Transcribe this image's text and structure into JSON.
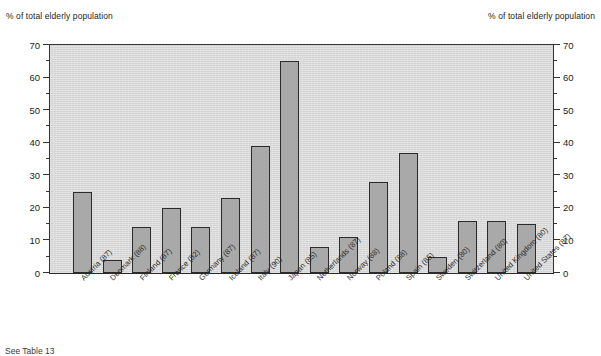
{
  "figure": {
    "axis_unit_label_left": "% of total elderly population",
    "axis_unit_label_right": "% of total elderly population",
    "footnote": "See Table 13"
  },
  "colors": {
    "plot_background": "#d3d3d3",
    "bar_fill": "#a9a9a9",
    "bar_border": "#2b2b2b",
    "axis": "#333333",
    "text": "#1d1d1d",
    "page_background": "#ffffff"
  },
  "chart_data": {
    "type": "bar",
    "title": "",
    "subtitle": "",
    "xlabel": "",
    "ylabel": "% of total elderly population",
    "ylabel_right": "% of total elderly population",
    "ylim": [
      0,
      70
    ],
    "yticks": [
      0,
      10,
      20,
      30,
      40,
      50,
      60,
      70
    ],
    "ytick_labels": [
      "0",
      "10",
      "20",
      "30",
      "40",
      "50",
      "60",
      "70"
    ],
    "yticks_minor": [
      5,
      15,
      25,
      35,
      45,
      55,
      65
    ],
    "grid": false,
    "legend": null,
    "legend_position": "none",
    "categories": [
      "Austria (87)",
      "Denmark (88)",
      "Finland (87)",
      "France (82)",
      "Germany (87)",
      "Iceland (87)",
      "Italy (90)",
      "Japan (85)",
      "Netherlands (87)",
      "Norway (88)",
      "Poland (88)",
      "Spain (85)",
      "Sweden (80)",
      "Switzerland (80)",
      "United Kingdom (80)",
      "United States (87)"
    ],
    "values": [
      25,
      4,
      14,
      20,
      14,
      23,
      39,
      65,
      8,
      11,
      28,
      37,
      5,
      16,
      16,
      15
    ]
  }
}
